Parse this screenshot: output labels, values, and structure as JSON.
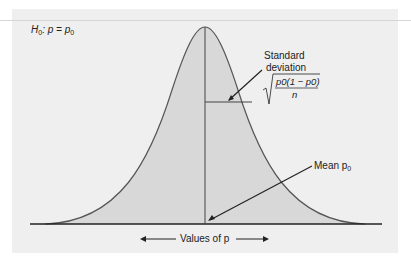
{
  "hypothesis": {
    "H": "H",
    "sub0": "0",
    "text": ": p = p",
    "sub1": "0"
  },
  "annotations": {
    "sd_line1": "Standard",
    "sd_line2": "deviation",
    "sd_numerator": "p0(1 − p0)",
    "sd_denominator": "n",
    "mean_label": "Mean p",
    "mean_sub": "0"
  },
  "axis": {
    "label": "Values of p"
  },
  "colors": {
    "panel": "#efefef",
    "fill": "#d8d8d8",
    "curve": "#555555",
    "line": "#222222"
  }
}
